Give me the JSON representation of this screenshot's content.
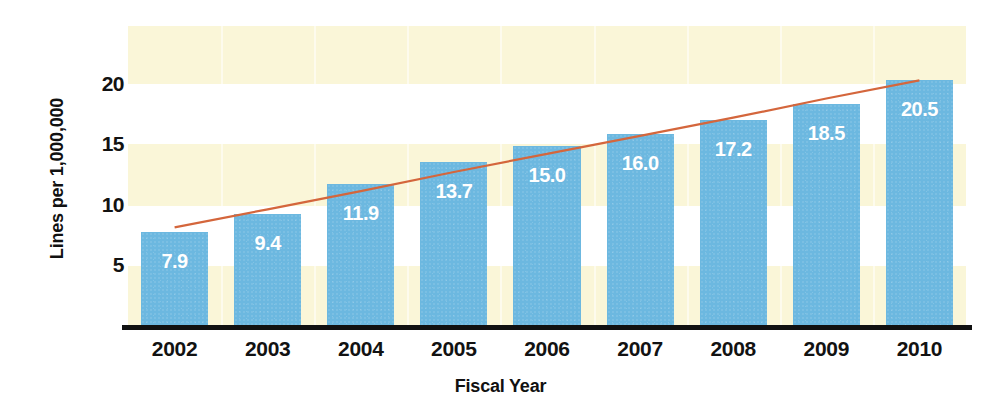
{
  "chart_data": {
    "type": "bar",
    "title": "",
    "xlabel": "Fiscal Year",
    "ylabel": "Lines per 1,000,000",
    "categories": [
      "2002",
      "2003",
      "2004",
      "2005",
      "2006",
      "2007",
      "2008",
      "2009",
      "2010"
    ],
    "values": [
      7.9,
      9.4,
      11.9,
      13.7,
      15.0,
      16.0,
      17.2,
      18.5,
      20.5
    ],
    "value_labels": [
      "7.9",
      "9.4",
      "11.9",
      "13.7",
      "15.0",
      "16.0",
      "17.2",
      "18.5",
      "20.5"
    ],
    "ytick_labels": [
      "5",
      "10",
      "15",
      "20"
    ],
    "ytick_values": [
      5,
      10,
      15,
      20
    ],
    "ylim": [
      0,
      25
    ],
    "grid": false,
    "legend": "none",
    "series": [
      {
        "name": "Lines per 1,000,000",
        "type": "bar",
        "values": [
          7.9,
          9.4,
          11.9,
          13.7,
          15.0,
          16.0,
          17.2,
          18.5,
          20.5
        ],
        "color": "#6cb8e0"
      },
      {
        "name": "trend",
        "type": "line",
        "values": [
          8.1,
          9.6,
          11.1,
          12.7,
          14.2,
          15.7,
          17.2,
          18.8,
          20.3
        ],
        "color": "#d4663c"
      }
    ]
  },
  "style": {
    "bar_color": "#6cb8e0",
    "band_color": "#faf6d8",
    "trendline_color": "#d4663c",
    "label_color": "#ffffff",
    "axis_color": "#111111",
    "background": "#ffffff"
  }
}
